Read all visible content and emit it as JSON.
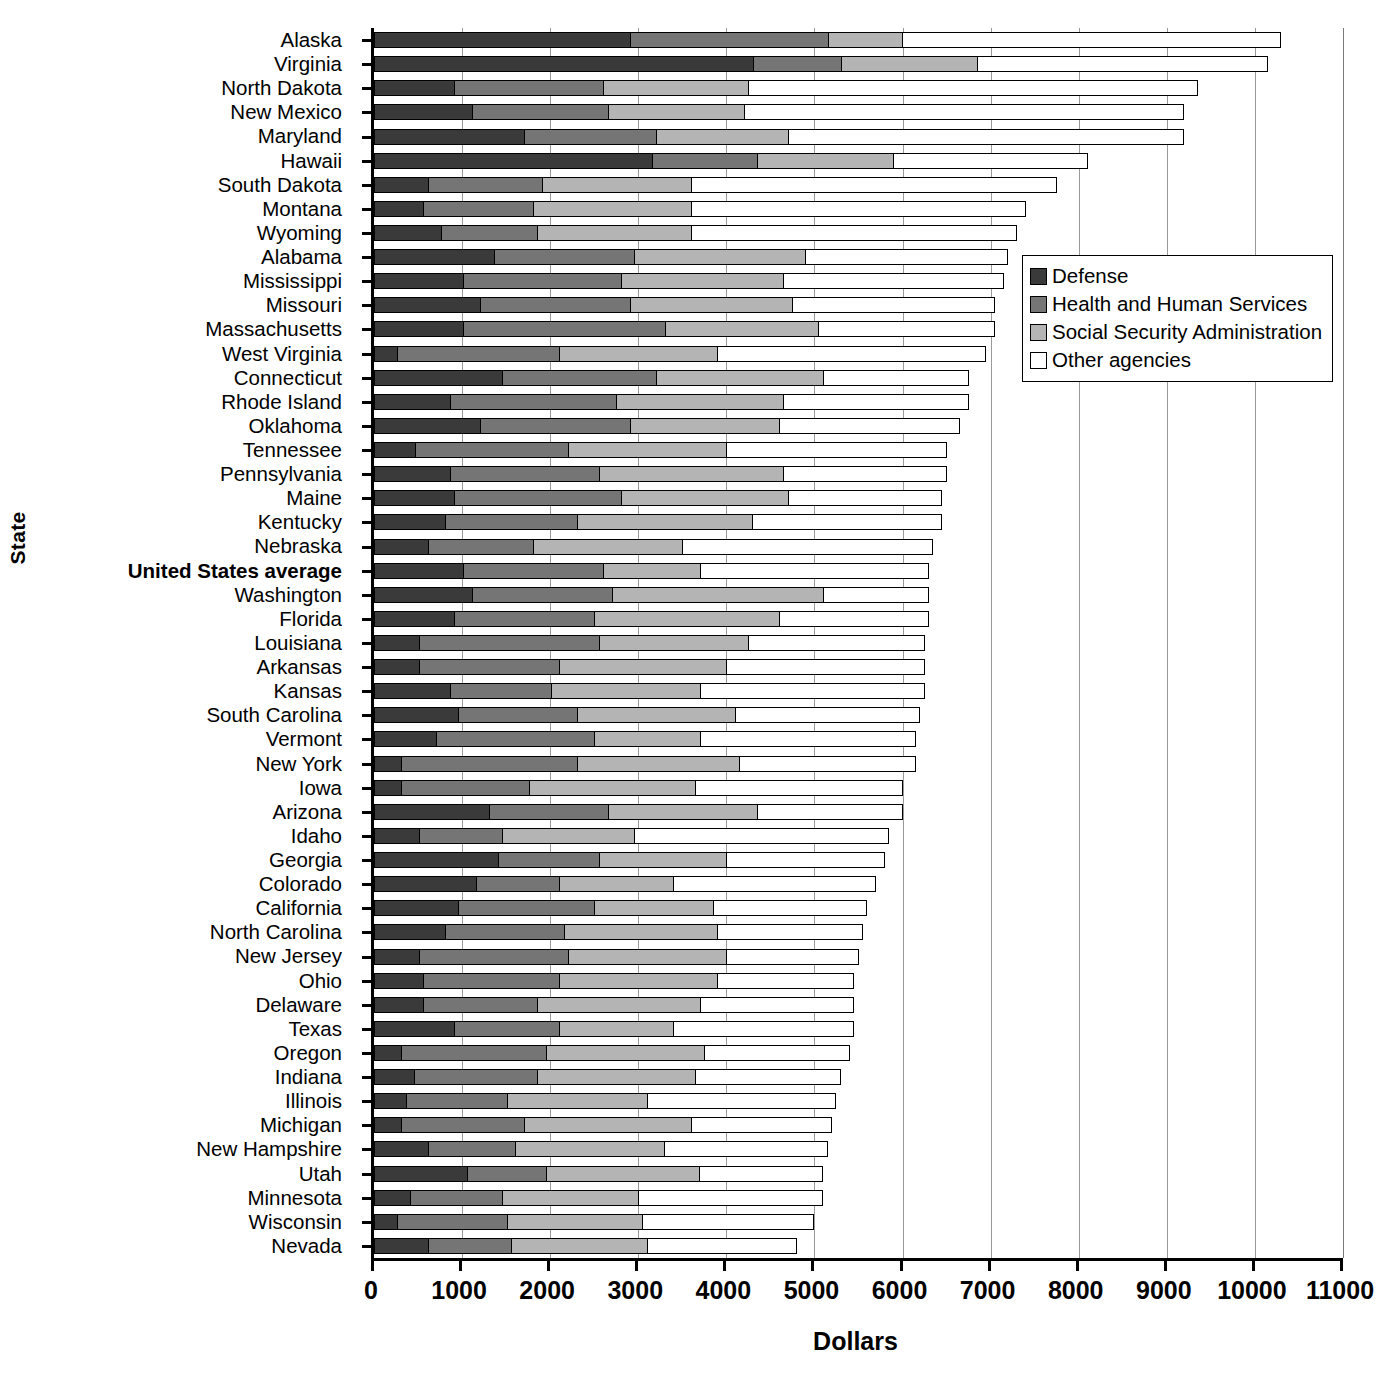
{
  "chart_data": {
    "type": "bar",
    "orientation": "horizontal",
    "stacked": true,
    "title": "",
    "xlabel": "Dollars",
    "ylabel": "State",
    "xlim": [
      0,
      11000
    ],
    "xticks": [
      0,
      1000,
      2000,
      3000,
      4000,
      5000,
      6000,
      7000,
      8000,
      9000,
      10000,
      11000
    ],
    "xtick_labels": [
      "0",
      "1000",
      "2000",
      "3000",
      "4000",
      "5000",
      "6000",
      "7000",
      "8000",
      "9000",
      "10000",
      "11000"
    ],
    "grid": "vertical",
    "legend_position": "upper-right-inside",
    "series": [
      {
        "name": "Defense",
        "color": "#3a3a3a"
      },
      {
        "name": "Health and Human Services",
        "color": "#757575"
      },
      {
        "name": "Social Security Administration",
        "color": "#b4b4b4"
      },
      {
        "name": "Other agencies",
        "color": "#ffffff"
      }
    ],
    "categories": [
      "Alaska",
      "Virginia",
      "North Dakota",
      "New Mexico",
      "Maryland",
      "Hawaii",
      "South Dakota",
      "Montana",
      "Wyoming",
      "Alabama",
      "Mississippi",
      "Missouri",
      "Massachusetts",
      "West Virginia",
      "Connecticut",
      "Rhode Island",
      "Oklahoma",
      "Tennessee",
      "Pennsylvania",
      "Maine",
      "Kentucky",
      "Nebraska",
      "United States average",
      "Washington",
      "Florida",
      "Louisiana",
      "Arkansas",
      "Kansas",
      "South Carolina",
      "Vermont",
      "New York",
      "Iowa",
      "Arizona",
      "Idaho",
      "Georgia",
      "Colorado",
      "California",
      "North Carolina",
      "New Jersey",
      "Ohio",
      "Delaware",
      "Texas",
      "Oregon",
      "Indiana",
      "Illinois",
      "Michigan",
      "New Hampshire",
      "Utah",
      "Minnesota",
      "Wisconsin",
      "Nevada"
    ],
    "highlight_category": "United States average",
    "rows": [
      {
        "state": "Alaska",
        "defense": 2900,
        "hhs": 2250,
        "ssa": 850,
        "other": 4300,
        "total": 10300
      },
      {
        "state": "Virginia",
        "defense": 4300,
        "hhs": 1000,
        "ssa": 1550,
        "other": 3300,
        "total": 10150
      },
      {
        "state": "North Dakota",
        "defense": 900,
        "hhs": 1700,
        "ssa": 1650,
        "other": 5100,
        "total": 9350
      },
      {
        "state": "New Mexico",
        "defense": 1100,
        "hhs": 1550,
        "ssa": 1550,
        "other": 5000,
        "total": 9200
      },
      {
        "state": "Maryland",
        "defense": 1700,
        "hhs": 1500,
        "ssa": 1500,
        "other": 4500,
        "total": 9200
      },
      {
        "state": "Hawaii",
        "defense": 3150,
        "hhs": 1200,
        "ssa": 1550,
        "other": 2200,
        "total": 8100
      },
      {
        "state": "South Dakota",
        "defense": 600,
        "hhs": 1300,
        "ssa": 1700,
        "other": 4150,
        "total": 7750
      },
      {
        "state": "Montana",
        "defense": 550,
        "hhs": 1250,
        "ssa": 1800,
        "other": 3800,
        "total": 7400
      },
      {
        "state": "Wyoming",
        "defense": 750,
        "hhs": 1100,
        "ssa": 1750,
        "other": 3700,
        "total": 7300
      },
      {
        "state": "Alabama",
        "defense": 1350,
        "hhs": 1600,
        "ssa": 1950,
        "other": 2300,
        "total": 7200
      },
      {
        "state": "Mississippi",
        "defense": 1000,
        "hhs": 1800,
        "ssa": 1850,
        "other": 2500,
        "total": 7150
      },
      {
        "state": "Missouri",
        "defense": 1200,
        "hhs": 1700,
        "ssa": 1850,
        "other": 2300,
        "total": 7050
      },
      {
        "state": "Massachusetts",
        "defense": 1000,
        "hhs": 2300,
        "ssa": 1750,
        "other": 2000,
        "total": 7050
      },
      {
        "state": "West Virginia",
        "defense": 250,
        "hhs": 1850,
        "ssa": 1800,
        "other": 3050,
        "total": 6950
      },
      {
        "state": "Connecticut",
        "defense": 1450,
        "hhs": 1750,
        "ssa": 1900,
        "other": 1650,
        "total": 6750
      },
      {
        "state": "Rhode Island",
        "defense": 850,
        "hhs": 1900,
        "ssa": 1900,
        "other": 2100,
        "total": 6750
      },
      {
        "state": "Oklahoma",
        "defense": 1200,
        "hhs": 1700,
        "ssa": 1700,
        "other": 2050,
        "total": 6650
      },
      {
        "state": "Tennessee",
        "defense": 450,
        "hhs": 1750,
        "ssa": 1800,
        "other": 2500,
        "total": 6500
      },
      {
        "state": "Pennsylvania",
        "defense": 850,
        "hhs": 1700,
        "ssa": 2100,
        "other": 1850,
        "total": 6500
      },
      {
        "state": "Maine",
        "defense": 900,
        "hhs": 1900,
        "ssa": 1900,
        "other": 1750,
        "total": 6450
      },
      {
        "state": "Kentucky",
        "defense": 800,
        "hhs": 1500,
        "ssa": 2000,
        "other": 2150,
        "total": 6450
      },
      {
        "state": "Nebraska",
        "defense": 600,
        "hhs": 1200,
        "ssa": 1700,
        "other": 2850,
        "total": 6350
      },
      {
        "state": "United States average",
        "defense": 1000,
        "hhs": 1600,
        "ssa": 1100,
        "other": 2600,
        "total": 6300
      },
      {
        "state": "Washington",
        "defense": 1100,
        "hhs": 1600,
        "ssa": 2400,
        "other": 1200,
        "total": 6300
      },
      {
        "state": "Florida",
        "defense": 900,
        "hhs": 1600,
        "ssa": 2100,
        "other": 1700,
        "total": 6300
      },
      {
        "state": "Louisiana",
        "defense": 500,
        "hhs": 2050,
        "ssa": 1700,
        "other": 2000,
        "total": 6250
      },
      {
        "state": "Arkansas",
        "defense": 500,
        "hhs": 1600,
        "ssa": 1900,
        "other": 2250,
        "total": 6250
      },
      {
        "state": "Kansas",
        "defense": 850,
        "hhs": 1150,
        "ssa": 1700,
        "other": 2550,
        "total": 6250
      },
      {
        "state": "South Carolina",
        "defense": 950,
        "hhs": 1350,
        "ssa": 1800,
        "other": 2100,
        "total": 6200
      },
      {
        "state": "Vermont",
        "defense": 700,
        "hhs": 1800,
        "ssa": 1200,
        "other": 2450,
        "total": 6150
      },
      {
        "state": "New York",
        "defense": 300,
        "hhs": 2000,
        "ssa": 1850,
        "other": 2000,
        "total": 6150
      },
      {
        "state": "Iowa",
        "defense": 300,
        "hhs": 1450,
        "ssa": 1900,
        "other": 2350,
        "total": 6000
      },
      {
        "state": "Arizona",
        "defense": 1300,
        "hhs": 1350,
        "ssa": 1700,
        "other": 1650,
        "total": 6000
      },
      {
        "state": "Idaho",
        "defense": 500,
        "hhs": 950,
        "ssa": 1500,
        "other": 2900,
        "total": 5850
      },
      {
        "state": "Georgia",
        "defense": 1400,
        "hhs": 1150,
        "ssa": 1450,
        "other": 1800,
        "total": 5800
      },
      {
        "state": "Colorado",
        "defense": 1150,
        "hhs": 950,
        "ssa": 1300,
        "other": 2300,
        "total": 5700
      },
      {
        "state": "California",
        "defense": 950,
        "hhs": 1550,
        "ssa": 1350,
        "other": 1750,
        "total": 5600
      },
      {
        "state": "North Carolina",
        "defense": 800,
        "hhs": 1350,
        "ssa": 1750,
        "other": 1650,
        "total": 5550
      },
      {
        "state": "New Jersey",
        "defense": 500,
        "hhs": 1700,
        "ssa": 1800,
        "other": 1500,
        "total": 5500
      },
      {
        "state": "Ohio",
        "defense": 550,
        "hhs": 1550,
        "ssa": 1800,
        "other": 1550,
        "total": 5450
      },
      {
        "state": "Delaware",
        "defense": 550,
        "hhs": 1300,
        "ssa": 1850,
        "other": 1750,
        "total": 5450
      },
      {
        "state": "Texas",
        "defense": 900,
        "hhs": 1200,
        "ssa": 1300,
        "other": 2050,
        "total": 5450
      },
      {
        "state": "Oregon",
        "defense": 300,
        "hhs": 1650,
        "ssa": 1800,
        "other": 1650,
        "total": 5400
      },
      {
        "state": "Indiana",
        "defense": 450,
        "hhs": 1400,
        "ssa": 1800,
        "other": 1650,
        "total": 5300
      },
      {
        "state": "Illinois",
        "defense": 350,
        "hhs": 1150,
        "ssa": 1600,
        "other": 2150,
        "total": 5250
      },
      {
        "state": "Michigan",
        "defense": 300,
        "hhs": 1400,
        "ssa": 1900,
        "other": 1600,
        "total": 5200
      },
      {
        "state": "New Hampshire",
        "defense": 600,
        "hhs": 1000,
        "ssa": 1700,
        "other": 1850,
        "total": 5150
      },
      {
        "state": "Utah",
        "defense": 1050,
        "hhs": 900,
        "ssa": 1750,
        "other": 1400,
        "total": 5100
      },
      {
        "state": "Minnesota",
        "defense": 400,
        "hhs": 1050,
        "ssa": 1550,
        "other": 2100,
        "total": 5100
      },
      {
        "state": "Wisconsin",
        "defense": 250,
        "hhs": 1250,
        "ssa": 1550,
        "other": 1950,
        "total": 5000
      },
      {
        "state": "Nevada",
        "defense": 600,
        "hhs": 950,
        "ssa": 1550,
        "other": 1700,
        "total": 4800
      }
    ]
  }
}
